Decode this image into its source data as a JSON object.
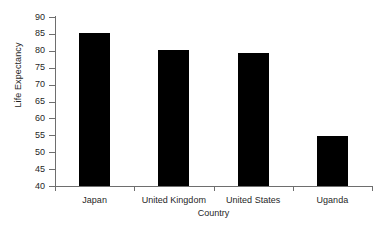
{
  "chart_data": {
    "type": "bar",
    "title": "",
    "xlabel": "Country",
    "ylabel": "Life Expectancy",
    "categories": [
      "Japan",
      "United Kingdom",
      "United States",
      "Uganda"
    ],
    "values": [
      85.3,
      80.2,
      79.5,
      54.7
    ],
    "ylim": [
      40,
      90
    ],
    "ytick_step": 5,
    "yticks": [
      40,
      45,
      50,
      55,
      60,
      65,
      70,
      75,
      80,
      85,
      90
    ],
    "ytick_labels": [
      "40",
      "45",
      "50",
      "55",
      "60",
      "65",
      "70",
      "75",
      "80",
      "85",
      "90"
    ],
    "grid": false,
    "legend": false,
    "legend_position": "none",
    "bar_color": "#000000",
    "axis_color": "#6e6e6e",
    "background_color": "#ffffff",
    "bar_width_px": 31
  }
}
